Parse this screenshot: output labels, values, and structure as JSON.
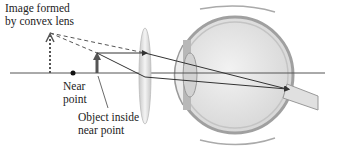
{
  "diagram": {
    "type": "optics-ray-diagram",
    "labels": {
      "image_label_line1": "Image formed",
      "image_label_line2": "by convex lens",
      "near_point_line1": "Near",
      "near_point_line2": "point",
      "object_line1": "Object inside",
      "object_line2": "near point"
    },
    "elements": [
      "optical-axis",
      "virtual-image-arrow",
      "near-point-dot",
      "object-arrow",
      "convex-lens",
      "eye-cross-section",
      "light-rays",
      "optic-nerve"
    ],
    "colors": {
      "ray": "#333333",
      "axis": "#555555",
      "lens": "#dcdcdc",
      "eye_fill": "#e6e6e6",
      "eye_outline": "#9a9a9a"
    }
  }
}
